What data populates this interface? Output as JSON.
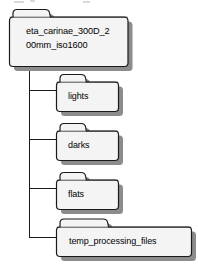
{
  "diagram": {
    "type": "folder-tree",
    "title": "",
    "root": {
      "name": "root-folder",
      "label": "eta_carinae_300D_2\n00mm_iso1600",
      "label_full": "eta_carinae_300D_200mm_iso1600"
    },
    "children": [
      {
        "name": "folder-lights",
        "label": "lights"
      },
      {
        "name": "folder-darks",
        "label": "darks"
      },
      {
        "name": "folder-flats",
        "label": "flats"
      },
      {
        "name": "folder-temp-processing-files",
        "label": "temp_processing_files"
      }
    ]
  },
  "colors": {
    "folder_fill": "#f4f4f4",
    "folder_fill_top": "#fbfbfb",
    "folder_stroke": "#1a1a1a",
    "folder_shadow": "#8c8c8c",
    "connector": "#1a1a1a",
    "text": "#000000",
    "background": "#ffffff"
  }
}
